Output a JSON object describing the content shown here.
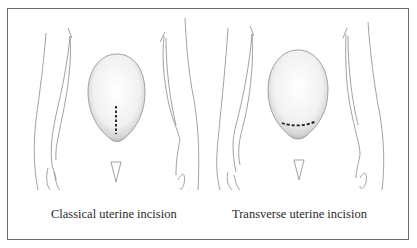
{
  "figure": {
    "panels": [
      {
        "id": "classical",
        "caption": "Classical uterine incision",
        "incision": "vertical-dashed"
      },
      {
        "id": "transverse",
        "caption": "Transverse uterine incision",
        "incision": "horizontal-dashed"
      }
    ],
    "colors": {
      "line": "#8a8a8a",
      "uterus_shade": "#c8c8c8",
      "incision": "#1a1a1a",
      "border": "#6a6a6a"
    }
  }
}
